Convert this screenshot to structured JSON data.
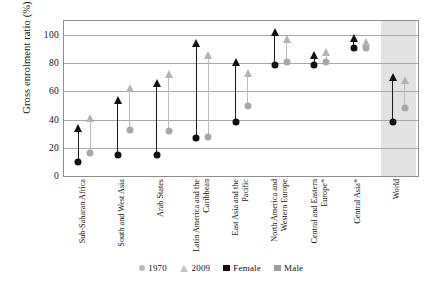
{
  "chart_data": {
    "type": "scatter",
    "title": "",
    "xlabel": "",
    "ylabel": "Gross enrolment ratio (%)",
    "ylim": [
      0,
      110
    ],
    "yticks": [
      0,
      20,
      40,
      60,
      80,
      100
    ],
    "grid": true,
    "legend_position": "bottom",
    "legend": [
      {
        "key": "1970",
        "marker": "circle",
        "label": "1970"
      },
      {
        "key": "2009",
        "marker": "triangle",
        "label": "2009"
      },
      {
        "key": "female",
        "marker": "square",
        "label": "Female",
        "color": "#111111"
      },
      {
        "key": "male",
        "marker": "square",
        "label": "Male",
        "color": "#9e9e9e"
      }
    ],
    "categories": [
      "Sub-Saharan Africa",
      "South and West Asia",
      "Arab States",
      "Latin America and the Caribbean",
      "East Asia and the Pacific",
      "North America and Western Europe",
      "Central and Eastern Europe*",
      "Central Asia*",
      "World"
    ],
    "highlighted_category": "World",
    "series": [
      {
        "name": "Female 1970",
        "sex": "female",
        "year": "1970",
        "marker": "circle",
        "values": [
          10,
          15,
          15,
          27,
          38,
          79,
          79,
          91,
          38
        ]
      },
      {
        "name": "Female 2009",
        "sex": "female",
        "year": "2009",
        "marker": "triangle",
        "values": [
          32,
          52,
          64,
          92,
          79,
          100,
          84,
          96,
          68
        ]
      },
      {
        "name": "Male 1970",
        "sex": "male",
        "year": "1970",
        "marker": "circle",
        "values": [
          16,
          33,
          32,
          28,
          50,
          81,
          81,
          91,
          48
        ]
      },
      {
        "name": "Male 2009",
        "sex": "male",
        "year": "2009",
        "marker": "triangle",
        "values": [
          39,
          60,
          70,
          84,
          71,
          95,
          86,
          93,
          66
        ]
      }
    ]
  }
}
